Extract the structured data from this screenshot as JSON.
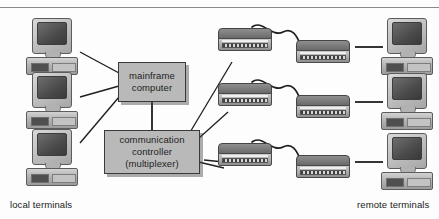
{
  "diagram": {
    "background_color": "#fdfdfd",
    "box_fill_color": "#b9b9b9",
    "box_border_color": "#3a3a3a",
    "line_color": "#1f1f1f",
    "rule_color": "#8a8a8a"
  },
  "boxes": [
    {
      "id": "mainframe",
      "lines": [
        "mainframe",
        "computer"
      ],
      "line1": "mainframe",
      "line2": "computer"
    },
    {
      "id": "controller",
      "lines": [
        "communication",
        "controller",
        "(multiplexer)"
      ],
      "line1": "communication",
      "line2": "controller",
      "line3": "(multiplexer)"
    }
  ],
  "captions": {
    "left": "local terminals",
    "right": "remote terminals"
  },
  "local_terminals": [
    {
      "index": 1,
      "name": "local-terminal-1"
    },
    {
      "index": 2,
      "name": "local-terminal-2"
    },
    {
      "index": 3,
      "name": "local-terminal-3"
    }
  ],
  "remote_terminals": [
    {
      "index": 1,
      "name": "remote-terminal-1"
    },
    {
      "index": 2,
      "name": "remote-terminal-2"
    },
    {
      "index": 3,
      "name": "remote-terminal-3"
    }
  ],
  "modem_pairs": [
    {
      "index": 1,
      "left": "modem-left-1",
      "right": "modem-right-1"
    },
    {
      "index": 2,
      "left": "modem-left-2",
      "right": "modem-right-2"
    },
    {
      "index": 3,
      "left": "modem-left-3",
      "right": "modem-right-3"
    }
  ]
}
